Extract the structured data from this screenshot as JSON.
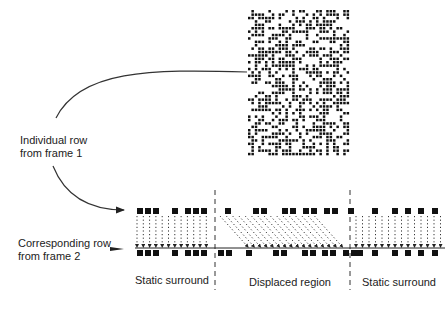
{
  "labels": {
    "row1_line1": "Individual row",
    "row1_line2": "from frame 1",
    "row2_line1": "Corresponding row",
    "row2_line2": "from frame 2",
    "region_left": "Static surround",
    "region_middle": "Displaced region",
    "region_right": "Static surround"
  },
  "random_dot_image": {
    "x": 248,
    "y": 10,
    "width": 102,
    "height": 148,
    "cell": 3.4,
    "density": 0.5
  },
  "rows": {
    "frame1_y": 208,
    "frame2_y": 250,
    "square_size": 6,
    "left_region": {
      "x_start": 135,
      "x_end": 212
    },
    "middle_region": {
      "x_start": 218,
      "x_end": 350
    },
    "right_region": {
      "x_start": 355,
      "x_end": 445
    },
    "separators_x": [
      215,
      350
    ],
    "frame1_squares": [
      137,
      145,
      153,
      172,
      185,
      193,
      201,
      225,
      253,
      261,
      282,
      290,
      303,
      311,
      324,
      332,
      348,
      372,
      392,
      405,
      418,
      432
    ],
    "frame2_squares": [
      137,
      145,
      153,
      172,
      185,
      193,
      201,
      218,
      226,
      246,
      273,
      281,
      302,
      310,
      322,
      330,
      343,
      351,
      357,
      372,
      392,
      405,
      418,
      432
    ]
  },
  "colors": {
    "ink": "#111111",
    "line": "#333333",
    "background": "#ffffff"
  }
}
